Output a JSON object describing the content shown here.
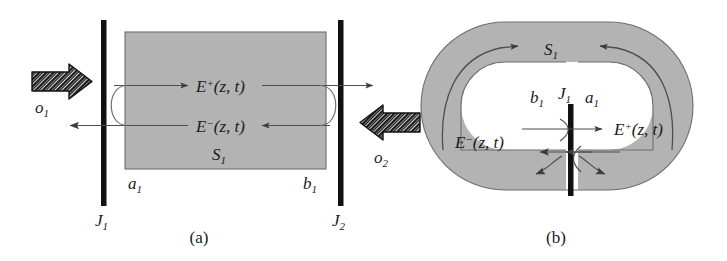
{
  "figure": {
    "background_color": "#ffffff",
    "ink_color": "#1a1a1a",
    "fill_gray": "#b3b3b3",
    "fill_gray_stroke": "#7a7a7a",
    "line_color": "#4d4d4d"
  },
  "panel_a": {
    "caption": "(a)",
    "region_label": "S",
    "region_label_sub": "1",
    "field_forward": "E",
    "field_forward_sup": "+",
    "field_forward_args": "(z, t)",
    "field_backward": "E",
    "field_backward_sup": "−",
    "field_backward_args": "(z, t)",
    "port_left": "o",
    "port_left_sub": "1",
    "port_right": "o",
    "port_right_sub": "2",
    "boundary_left": "a",
    "boundary_left_sub": "1",
    "boundary_right": "b",
    "boundary_right_sub": "1",
    "junction_left": "J",
    "junction_left_sub": "1",
    "junction_right": "J",
    "junction_right_sub": "2"
  },
  "panel_b": {
    "caption": "(b)",
    "region_label": "S",
    "region_label_sub": "1",
    "field_forward": "E",
    "field_forward_sup": "+",
    "field_forward_args": "(z, t)",
    "field_backward": "E",
    "field_backward_sup": "−",
    "field_backward_args": "(z, t)",
    "boundary_left": "b",
    "boundary_left_sub": "1",
    "boundary_right": "a",
    "boundary_right_sub": "1",
    "junction": "J",
    "junction_sub": "1"
  }
}
